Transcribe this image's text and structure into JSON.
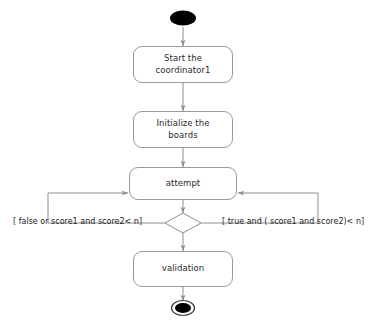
{
  "diagram": {
    "type": "uml-activity-diagram",
    "colors": {
      "background": "#ffffff",
      "node_border": "#9a9a9a",
      "node_fill": "#ffffff",
      "edge": "#8e8e8e",
      "text": "#2b2b2b",
      "terminal_fill": "#000000"
    },
    "nodes": [
      {
        "id": "initial-node",
        "kind": "initial",
        "label": ""
      },
      {
        "id": "start-coordinator",
        "kind": "action",
        "label": "Start the\ncoordinator1"
      },
      {
        "id": "initialize-boards",
        "kind": "action",
        "label": "Initialize the\nboards"
      },
      {
        "id": "attempt",
        "kind": "action",
        "label": "attempt"
      },
      {
        "id": "decision",
        "kind": "decision",
        "label": ""
      },
      {
        "id": "validation",
        "kind": "action",
        "label": "validation"
      },
      {
        "id": "final-node",
        "kind": "final",
        "label": ""
      }
    ],
    "guards": {
      "left": "[ false or score1 and score2< n]",
      "right": "[ true and ( score1 and score2)< n]"
    }
  }
}
